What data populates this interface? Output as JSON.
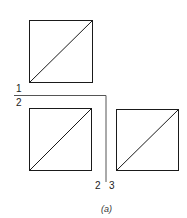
{
  "diagram": {
    "caption": "(a)",
    "partition_labels": {
      "top": "1",
      "bottom": "2",
      "left": "2",
      "right": "3"
    },
    "squares": [
      {
        "name": "square-1",
        "region": "top",
        "diagonal": "bottom-left to top-right"
      },
      {
        "name": "square-2",
        "region": "bottom-left",
        "diagonal": "bottom-left to top-right"
      },
      {
        "name": "square-3",
        "region": "bottom-right",
        "diagonal": "bottom-left to top-right"
      }
    ],
    "colors": {
      "stroke": "#1a1a1a",
      "background": "#ffffff"
    }
  }
}
